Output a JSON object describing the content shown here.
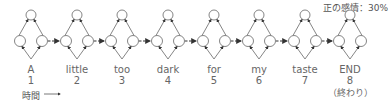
{
  "sentiment_label": "正の感情：30%",
  "time_label": "時間",
  "end_note": "（終わり）",
  "tokens": [
    {
      "word": "A",
      "index": "1"
    },
    {
      "word": "little",
      "index": "2"
    },
    {
      "word": "too",
      "index": "3"
    },
    {
      "word": "dark",
      "index": "4"
    },
    {
      "word": "for",
      "index": "5"
    },
    {
      "word": "my",
      "index": "6"
    },
    {
      "word": "taste",
      "index": "7"
    },
    {
      "word": "END",
      "index": "8"
    }
  ],
  "colors": {
    "line": "#777777",
    "arrow": "#333333",
    "text": "#555555"
  }
}
